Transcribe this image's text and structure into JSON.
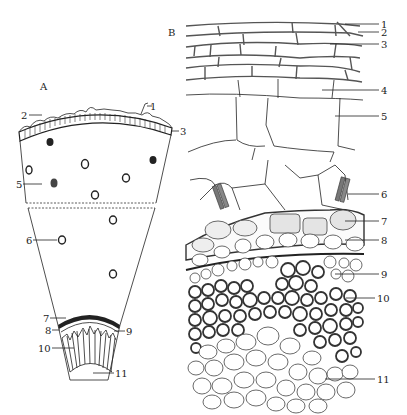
{
  "figure": {
    "panel_a": {
      "label": "A",
      "callouts": [
        {
          "id": "1",
          "text": "1"
        },
        {
          "id": "2",
          "text": "2"
        },
        {
          "id": "3",
          "text": "3"
        },
        {
          "id": "5",
          "text": "5"
        },
        {
          "id": "6",
          "text": "6"
        },
        {
          "id": "7",
          "text": "7"
        },
        {
          "id": "8",
          "text": "8"
        },
        {
          "id": "9",
          "text": "9"
        },
        {
          "id": "10",
          "text": "10"
        },
        {
          "id": "11",
          "text": "11"
        }
      ]
    },
    "panel_b": {
      "label": "B",
      "callouts": [
        {
          "id": "1",
          "text": "1"
        },
        {
          "id": "2",
          "text": "2"
        },
        {
          "id": "3",
          "text": "3"
        },
        {
          "id": "4",
          "text": "4"
        },
        {
          "id": "5",
          "text": "5"
        },
        {
          "id": "6",
          "text": "6"
        },
        {
          "id": "7",
          "text": "7"
        },
        {
          "id": "8",
          "text": "8"
        },
        {
          "id": "9",
          "text": "9"
        },
        {
          "id": "10",
          "text": "10"
        },
        {
          "id": "11",
          "text": "11"
        }
      ]
    }
  }
}
